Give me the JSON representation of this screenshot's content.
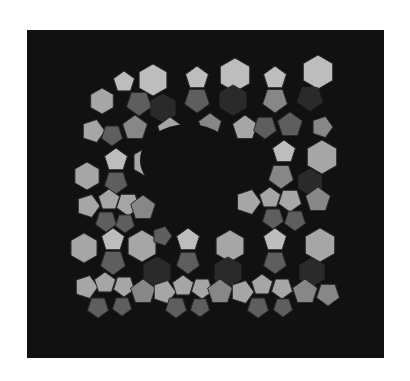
{
  "figure": {
    "background": "#111111",
    "frame": {
      "x": 27,
      "y": 30,
      "width": 357,
      "height": 328
    },
    "palette": {
      "light": "#bdbdbd",
      "lightmid": "#a6a6a6",
      "mid": "#878787",
      "dark": "#5e5e5e",
      "deep": "#2a2a2a",
      "edge": "#2b2b2b"
    },
    "cavity": {
      "cx": 188,
      "cy": 160,
      "rx": 48,
      "ry": 36
    },
    "faces": [
      {
        "x": 102,
        "y": 101,
        "n": 6,
        "r": 13,
        "rot": 0,
        "s": "lightmid"
      },
      {
        "x": 124,
        "y": 82,
        "n": 5,
        "r": 11,
        "rot": 0,
        "s": "light"
      },
      {
        "x": 153,
        "y": 80,
        "n": 6,
        "r": 16,
        "rot": 0,
        "s": "light"
      },
      {
        "x": 139,
        "y": 103,
        "n": 5,
        "r": 13,
        "rot": 180,
        "s": "dark"
      },
      {
        "x": 163,
        "y": 108,
        "n": 6,
        "r": 14,
        "rot": 0,
        "s": "deep"
      },
      {
        "x": 197,
        "y": 78,
        "n": 5,
        "r": 12,
        "rot": 0,
        "s": "light"
      },
      {
        "x": 197,
        "y": 100,
        "n": 5,
        "r": 13,
        "rot": 180,
        "s": "dark"
      },
      {
        "x": 235,
        "y": 75,
        "n": 6,
        "r": 17,
        "rot": 0,
        "s": "light"
      },
      {
        "x": 233,
        "y": 100,
        "n": 6,
        "r": 15,
        "rot": 0,
        "s": "deep"
      },
      {
        "x": 275,
        "y": 78,
        "n": 5,
        "r": 12,
        "rot": 0,
        "s": "light"
      },
      {
        "x": 275,
        "y": 100,
        "n": 5,
        "r": 13,
        "rot": 180,
        "s": "mid"
      },
      {
        "x": 318,
        "y": 72,
        "n": 6,
        "r": 17,
        "rot": 0,
        "s": "light"
      },
      {
        "x": 310,
        "y": 98,
        "n": 5,
        "r": 13,
        "rot": 180,
        "s": "deep"
      },
      {
        "x": 93,
        "y": 131,
        "n": 5,
        "r": 12,
        "rot": 90,
        "s": "lightmid"
      },
      {
        "x": 112,
        "y": 135,
        "n": 5,
        "r": 11,
        "rot": 180,
        "s": "dark"
      },
      {
        "x": 135,
        "y": 128,
        "n": 5,
        "r": 13,
        "rot": 0,
        "s": "mid"
      },
      {
        "x": 170,
        "y": 130,
        "n": 5,
        "r": 13,
        "rot": 0,
        "s": "lightmid"
      },
      {
        "x": 190,
        "y": 135,
        "n": 5,
        "r": 11,
        "rot": 180,
        "s": "dark"
      },
      {
        "x": 210,
        "y": 125,
        "n": 5,
        "r": 12,
        "rot": 0,
        "s": "mid"
      },
      {
        "x": 245,
        "y": 128,
        "n": 5,
        "r": 13,
        "rot": 0,
        "s": "lightmid"
      },
      {
        "x": 265,
        "y": 127,
        "n": 5,
        "r": 12,
        "rot": 180,
        "s": "dark"
      },
      {
        "x": 290,
        "y": 125,
        "n": 5,
        "r": 13,
        "rot": 0,
        "s": "dark"
      },
      {
        "x": 322,
        "y": 127,
        "n": 5,
        "r": 11,
        "rot": 90,
        "s": "mid"
      },
      {
        "x": 87,
        "y": 176,
        "n": 6,
        "r": 14,
        "rot": 0,
        "s": "lightmid"
      },
      {
        "x": 116,
        "y": 160,
        "n": 5,
        "r": 12,
        "rot": 0,
        "s": "light"
      },
      {
        "x": 147,
        "y": 162,
        "n": 6,
        "r": 15,
        "rot": 0,
        "s": "lightmid"
      },
      {
        "x": 116,
        "y": 182,
        "n": 5,
        "r": 12,
        "rot": 180,
        "s": "dark"
      },
      {
        "x": 284,
        "y": 152,
        "n": 5,
        "r": 12,
        "rot": 0,
        "s": "light"
      },
      {
        "x": 322,
        "y": 157,
        "n": 6,
        "r": 17,
        "rot": 0,
        "s": "lightmid"
      },
      {
        "x": 281,
        "y": 176,
        "n": 5,
        "r": 13,
        "rot": 180,
        "s": "mid"
      },
      {
        "x": 310,
        "y": 182,
        "n": 6,
        "r": 13,
        "rot": 0,
        "s": "deep"
      },
      {
        "x": 88,
        "y": 206,
        "n": 5,
        "r": 12,
        "rot": 90,
        "s": "lightmid"
      },
      {
        "x": 109,
        "y": 200,
        "n": 5,
        "r": 11,
        "rot": 0,
        "s": "lightmid"
      },
      {
        "x": 128,
        "y": 204,
        "n": 5,
        "r": 12,
        "rot": 180,
        "s": "lightmid"
      },
      {
        "x": 143,
        "y": 208,
        "n": 5,
        "r": 13,
        "rot": 0,
        "s": "mid"
      },
      {
        "x": 106,
        "y": 221,
        "n": 5,
        "r": 11,
        "rot": 180,
        "s": "dark"
      },
      {
        "x": 125,
        "y": 223,
        "n": 5,
        "r": 10,
        "rot": 180,
        "s": "dark"
      },
      {
        "x": 248,
        "y": 202,
        "n": 5,
        "r": 13,
        "rot": 90,
        "s": "lightmid"
      },
      {
        "x": 270,
        "y": 198,
        "n": 5,
        "r": 11,
        "rot": 0,
        "s": "lightmid"
      },
      {
        "x": 290,
        "y": 200,
        "n": 5,
        "r": 12,
        "rot": 180,
        "s": "lightmid"
      },
      {
        "x": 318,
        "y": 200,
        "n": 5,
        "r": 13,
        "rot": 0,
        "s": "mid"
      },
      {
        "x": 273,
        "y": 218,
        "n": 5,
        "r": 11,
        "rot": 180,
        "s": "dark"
      },
      {
        "x": 295,
        "y": 220,
        "n": 5,
        "r": 11,
        "rot": 180,
        "s": "dark"
      },
      {
        "x": 84,
        "y": 248,
        "n": 6,
        "r": 15,
        "rot": 0,
        "s": "lightmid"
      },
      {
        "x": 113,
        "y": 240,
        "n": 5,
        "r": 12,
        "rot": 0,
        "s": "light"
      },
      {
        "x": 142,
        "y": 246,
        "n": 6,
        "r": 16,
        "rot": 0,
        "s": "lightmid"
      },
      {
        "x": 162,
        "y": 236,
        "n": 5,
        "r": 10,
        "rot": 90,
        "s": "dark"
      },
      {
        "x": 188,
        "y": 240,
        "n": 5,
        "r": 12,
        "rot": 0,
        "s": "light"
      },
      {
        "x": 230,
        "y": 246,
        "n": 6,
        "r": 16,
        "rot": 0,
        "s": "lightmid"
      },
      {
        "x": 275,
        "y": 240,
        "n": 5,
        "r": 12,
        "rot": 0,
        "s": "light"
      },
      {
        "x": 320,
        "y": 245,
        "n": 6,
        "r": 17,
        "rot": 0,
        "s": "lightmid"
      },
      {
        "x": 113,
        "y": 262,
        "n": 5,
        "r": 13,
        "rot": 180,
        "s": "dark"
      },
      {
        "x": 157,
        "y": 272,
        "n": 6,
        "r": 15,
        "rot": 0,
        "s": "deep"
      },
      {
        "x": 188,
        "y": 262,
        "n": 5,
        "r": 12,
        "rot": 180,
        "s": "dark"
      },
      {
        "x": 228,
        "y": 272,
        "n": 6,
        "r": 15,
        "rot": 0,
        "s": "deep"
      },
      {
        "x": 275,
        "y": 262,
        "n": 5,
        "r": 12,
        "rot": 180,
        "s": "dark"
      },
      {
        "x": 312,
        "y": 272,
        "n": 6,
        "r": 14,
        "rot": 0,
        "s": "deep"
      },
      {
        "x": 86,
        "y": 287,
        "n": 5,
        "r": 12,
        "rot": 90,
        "s": "lightmid"
      },
      {
        "x": 105,
        "y": 283,
        "n": 5,
        "r": 11,
        "rot": 0,
        "s": "lightmid"
      },
      {
        "x": 124,
        "y": 286,
        "n": 5,
        "r": 11,
        "rot": 180,
        "s": "lightmid"
      },
      {
        "x": 143,
        "y": 292,
        "n": 5,
        "r": 13,
        "rot": 0,
        "s": "mid"
      },
      {
        "x": 164,
        "y": 292,
        "n": 5,
        "r": 12,
        "rot": 90,
        "s": "lightmid"
      },
      {
        "x": 183,
        "y": 286,
        "n": 5,
        "r": 11,
        "rot": 0,
        "s": "lightmid"
      },
      {
        "x": 202,
        "y": 288,
        "n": 5,
        "r": 11,
        "rot": 180,
        "s": "lightmid"
      },
      {
        "x": 220,
        "y": 292,
        "n": 5,
        "r": 13,
        "rot": 0,
        "s": "mid"
      },
      {
        "x": 242,
        "y": 292,
        "n": 5,
        "r": 12,
        "rot": 90,
        "s": "lightmid"
      },
      {
        "x": 262,
        "y": 285,
        "n": 5,
        "r": 11,
        "rot": 0,
        "s": "lightmid"
      },
      {
        "x": 282,
        "y": 288,
        "n": 5,
        "r": 11,
        "rot": 180,
        "s": "lightmid"
      },
      {
        "x": 305,
        "y": 292,
        "n": 5,
        "r": 13,
        "rot": 0,
        "s": "mid"
      },
      {
        "x": 328,
        "y": 294,
        "n": 5,
        "r": 12,
        "rot": 180,
        "s": "mid"
      },
      {
        "x": 98,
        "y": 307,
        "n": 5,
        "r": 11,
        "rot": 180,
        "s": "dark"
      },
      {
        "x": 122,
        "y": 306,
        "n": 5,
        "r": 10,
        "rot": 180,
        "s": "dark"
      },
      {
        "x": 176,
        "y": 307,
        "n": 5,
        "r": 11,
        "rot": 180,
        "s": "dark"
      },
      {
        "x": 200,
        "y": 307,
        "n": 5,
        "r": 10,
        "rot": 180,
        "s": "dark"
      },
      {
        "x": 258,
        "y": 307,
        "n": 5,
        "r": 11,
        "rot": 180,
        "s": "dark"
      },
      {
        "x": 283,
        "y": 307,
        "n": 5,
        "r": 10,
        "rot": 180,
        "s": "dark"
      }
    ]
  }
}
